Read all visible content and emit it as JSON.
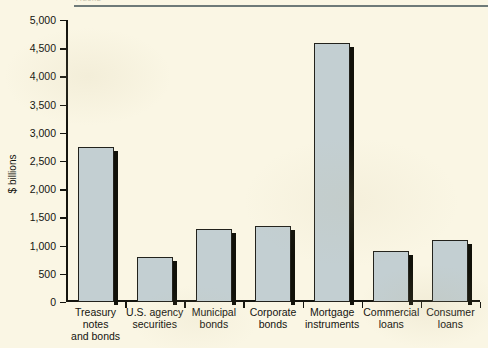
{
  "header": {
    "caption": "FIGURE",
    "rule_color": "#6e7a79"
  },
  "chart_data": {
    "type": "bar",
    "title": "",
    "xlabel": "",
    "ylabel": "$ billions",
    "ylim": [
      0,
      5000
    ],
    "ytick_step": 500,
    "grid": false,
    "legend": null,
    "categories": [
      "Treasury\nnotes\nand bonds",
      "U.S. agency\nsecurities",
      "Municipal\nbonds",
      "Corporate\nbonds",
      "Mortgage\ninstruments",
      "Commercial\nloans",
      "Consumer\nloans"
    ],
    "category_lines": [
      [
        "Treasury",
        "notes",
        "and bonds"
      ],
      [
        "U.S. agency",
        "securities"
      ],
      [
        "Municipal",
        "bonds"
      ],
      [
        "Corporate",
        "bonds"
      ],
      [
        "Mortgage",
        "instruments"
      ],
      [
        "Commercial",
        "loans"
      ],
      [
        "Consumer",
        "loans"
      ]
    ],
    "values": [
      2750,
      800,
      1290,
      1350,
      4600,
      900,
      1100
    ],
    "ytick_labels": [
      "0",
      "500",
      "1,000",
      "1,500",
      "2,000",
      "2,500",
      "3,000",
      "3,500",
      "4,000",
      "4,500",
      "5,000"
    ],
    "ytick_values": [
      0,
      500,
      1000,
      1500,
      2000,
      2500,
      3000,
      3500,
      4000,
      4500,
      5000
    ],
    "bar_fill": "#c3cfd2",
    "bar_edge": "#22221c",
    "bar_shadow": "#111109",
    "background": "#faf6e4"
  }
}
